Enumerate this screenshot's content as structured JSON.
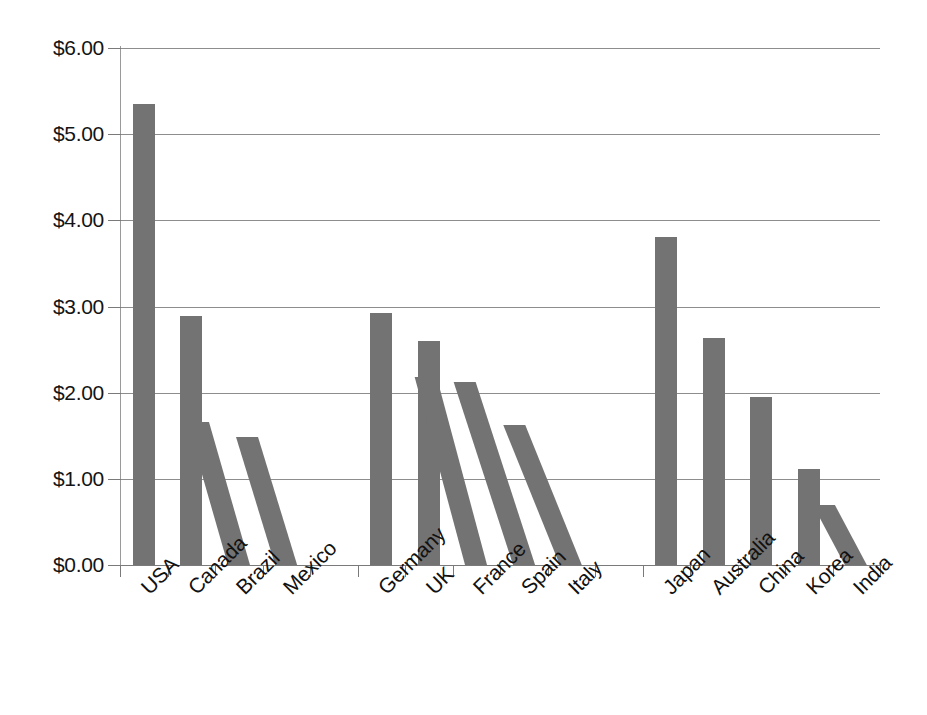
{
  "chart_data": {
    "type": "bar",
    "title": "",
    "subtitle": "",
    "xlabel": "",
    "ylabel": "",
    "ylim": [
      0,
      6
    ],
    "ytick_values": [
      0,
      1,
      2,
      3,
      4,
      5,
      6
    ],
    "ytick_labels": [
      "$0.00",
      "$1.00",
      "$2.00",
      "$3.00",
      "$4.00",
      "$5.00",
      "$6.00"
    ],
    "grid": true,
    "legend": "none",
    "currency": "USD",
    "value_format": "$0.00",
    "bar_color": "#737373",
    "gridline_color": "#8d8d8d",
    "axis_color": "#7a7a7a",
    "categories": [
      "USA",
      "Canada",
      "Brazil",
      "Mexico",
      "",
      "Germany",
      "UK",
      "France",
      "Spain",
      "Italy",
      "",
      "Japan",
      "Australia",
      "China",
      "Korea",
      "India"
    ],
    "values": [
      5.35,
      2.89,
      1.66,
      1.48,
      null,
      2.93,
      2.6,
      2.18,
      2.12,
      1.63,
      null,
      3.81,
      2.63,
      1.95,
      1.11,
      0.7
    ],
    "bars": [
      {
        "label": "USA",
        "value": 5.35,
        "skew_deg": 0,
        "group": "americas"
      },
      {
        "label": "Canada",
        "value": 2.89,
        "skew_deg": 0,
        "group": "americas"
      },
      {
        "label": "Brazil",
        "value": 1.66,
        "skew_deg": 16,
        "group": "americas"
      },
      {
        "label": "Mexico",
        "value": 1.48,
        "skew_deg": 17,
        "group": "americas"
      },
      {
        "label": "",
        "value": null,
        "skew_deg": 0,
        "group": "spacer"
      },
      {
        "label": "Germany",
        "value": 2.93,
        "skew_deg": 0,
        "group": "europe"
      },
      {
        "label": "UK",
        "value": 2.6,
        "skew_deg": 0,
        "group": "europe"
      },
      {
        "label": "France",
        "value": 2.18,
        "skew_deg": 15,
        "group": "europe"
      },
      {
        "label": "Spain",
        "value": 2.12,
        "skew_deg": 18,
        "group": "europe"
      },
      {
        "label": "Italy",
        "value": 1.63,
        "skew_deg": 22,
        "group": "europe"
      },
      {
        "label": "",
        "value": null,
        "skew_deg": 0,
        "group": "spacer"
      },
      {
        "label": "Japan",
        "value": 3.81,
        "skew_deg": 0,
        "group": "asiapac"
      },
      {
        "label": "Australia",
        "value": 2.63,
        "skew_deg": 0,
        "group": "asiapac"
      },
      {
        "label": "China",
        "value": 1.95,
        "skew_deg": 0,
        "group": "asiapac"
      },
      {
        "label": "Korea",
        "value": 1.11,
        "skew_deg": 0,
        "group": "asiapac"
      },
      {
        "label": "India",
        "value": 0.7,
        "skew_deg": 28,
        "group": "asiapac"
      }
    ]
  }
}
